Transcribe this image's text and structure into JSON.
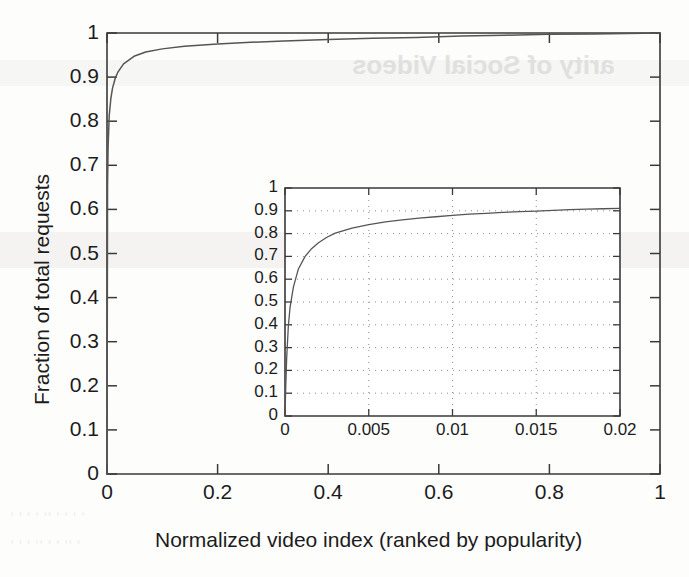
{
  "figure": {
    "kind": "scanned-figure",
    "background_artifacts": {
      "bleed_text_top_right": "arity of Social Videos",
      "note": "faint mirrored show-through text from reverse of scanned page"
    }
  },
  "chart_data": [
    {
      "id": "main-plot",
      "type": "line",
      "title": "",
      "xlabel": "Normalized video index (ranked by popularity)",
      "ylabel": "Fraction of total requests",
      "xlim": [
        0,
        1
      ],
      "ylim": [
        0,
        1
      ],
      "xticks": [
        "0",
        "0.2",
        "0.4",
        "0.6",
        "0.8",
        "1"
      ],
      "xtick_values": [
        0,
        0.2,
        0.4,
        0.6,
        0.8,
        1
      ],
      "yticks": [
        "0",
        "0.1",
        "0.2",
        "0.3",
        "0.4",
        "0.5",
        "0.6",
        "0.7",
        "0.8",
        "0.9",
        "1"
      ],
      "ytick_values": [
        0,
        0.1,
        0.2,
        0.3,
        0.4,
        0.5,
        0.6,
        0.7,
        0.8,
        0.9,
        1
      ],
      "grid": false,
      "legend": "none",
      "series": [
        {
          "name": "CDF of requests",
          "x": [
            0,
            0.001,
            0.002,
            0.004,
            0.007,
            0.01,
            0.015,
            0.02,
            0.03,
            0.05,
            0.07,
            0.1,
            0.14,
            0.2,
            0.26,
            0.32,
            0.4,
            0.48,
            0.56,
            0.64,
            0.72,
            0.8,
            0.88,
            0.94,
            1
          ],
          "y": [
            0.0,
            0.655,
            0.743,
            0.812,
            0.852,
            0.875,
            0.898,
            0.912,
            0.93,
            0.948,
            0.957,
            0.964,
            0.97,
            0.975,
            0.979,
            0.982,
            0.985,
            0.988,
            0.99,
            0.993,
            0.995,
            0.997,
            0.998,
            0.999,
            1.0
          ]
        }
      ]
    },
    {
      "id": "inset-plot",
      "type": "line",
      "title": "",
      "xlabel": "",
      "ylabel": "",
      "xlim": [
        0,
        0.02
      ],
      "ylim": [
        0,
        1
      ],
      "xticks": [
        "0",
        "0.005",
        "0.01",
        "0.015",
        "0.02"
      ],
      "xtick_values": [
        0,
        0.005,
        0.01,
        0.015,
        0.02
      ],
      "yticks": [
        "0",
        "0.1",
        "0.2",
        "0.3",
        "0.4",
        "0.5",
        "0.6",
        "0.7",
        "0.8",
        "0.9",
        "1"
      ],
      "ytick_values": [
        0,
        0.1,
        0.2,
        0.3,
        0.4,
        0.5,
        0.6,
        0.7,
        0.8,
        0.9,
        1
      ],
      "grid": true,
      "grid_style": "dotted",
      "legend": "none",
      "series": [
        {
          "name": "CDF of requests (zoomed)",
          "x": [
            0,
            5e-05,
            0.0001,
            0.0002,
            0.0003,
            0.0005,
            0.0008,
            0.0012,
            0.0016,
            0.002,
            0.0025,
            0.003,
            0.004,
            0.005,
            0.006,
            0.007,
            0.008,
            0.009,
            0.01,
            0.011,
            0.012,
            0.013,
            0.014,
            0.015,
            0.016,
            0.017,
            0.018,
            0.019,
            0.02
          ],
          "y": [
            0.0,
            0.14,
            0.255,
            0.395,
            0.475,
            0.565,
            0.645,
            0.7,
            0.735,
            0.76,
            0.784,
            0.802,
            0.824,
            0.839,
            0.851,
            0.86,
            0.868,
            0.874,
            0.88,
            0.885,
            0.889,
            0.893,
            0.896,
            0.899,
            0.902,
            0.905,
            0.907,
            0.909,
            0.911
          ]
        }
      ]
    }
  ]
}
